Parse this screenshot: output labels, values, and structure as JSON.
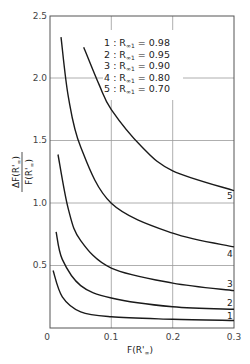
{
  "chart_data": {
    "type": "line",
    "title": "",
    "xlabel": "F(R'∞)",
    "ylabel": "ΔF(R'∞) / F(R'∞)",
    "xlim": [
      0,
      0.3
    ],
    "ylim": [
      0,
      2.5
    ],
    "xticks": [
      "0",
      "0.1",
      "0.2",
      "0.3"
    ],
    "yticks": [
      "0.5",
      "1.0",
      "1.5",
      "2.0",
      "2.5"
    ],
    "grid": true,
    "legend_position": "upper right (inside)",
    "legend": [
      {
        "id": "1",
        "label": "1 : R∞1 = 0.98"
      },
      {
        "id": "2",
        "label": "2 : R∞1 = 0.95"
      },
      {
        "id": "3",
        "label": "3 : R∞1 = 0.90"
      },
      {
        "id": "4",
        "label": "4 : R∞1 = 0.80"
      },
      {
        "id": "5",
        "label": "5 : R∞1 = 0.70"
      }
    ],
    "series": [
      {
        "name": "1",
        "R_inf1": 0.98,
        "x": [
          0.005,
          0.02,
          0.05,
          0.1,
          0.2,
          0.3
        ],
        "y": [
          0.46,
          0.25,
          0.13,
          0.09,
          0.07,
          0.06
        ]
      },
      {
        "name": "2",
        "R_inf1": 0.95,
        "x": [
          0.01,
          0.02,
          0.05,
          0.1,
          0.2,
          0.3
        ],
        "y": [
          0.77,
          0.55,
          0.34,
          0.24,
          0.17,
          0.15
        ]
      },
      {
        "name": "3",
        "R_inf1": 0.9,
        "x": [
          0.013,
          0.03,
          0.05,
          0.1,
          0.2,
          0.3
        ],
        "y": [
          1.39,
          0.95,
          0.7,
          0.48,
          0.36,
          0.3
        ]
      },
      {
        "name": "4",
        "R_inf1": 0.8,
        "x": [
          0.018,
          0.03,
          0.05,
          0.1,
          0.2,
          0.3
        ],
        "y": [
          2.33,
          1.85,
          1.45,
          1.0,
          0.76,
          0.65
        ]
      },
      {
        "name": "5",
        "R_inf1": 0.7,
        "x": [
          0.055,
          0.08,
          0.1,
          0.15,
          0.2,
          0.3
        ],
        "y": [
          2.25,
          1.95,
          1.75,
          1.45,
          1.26,
          1.1
        ]
      }
    ],
    "curve_end_labels": [
      "1",
      "2",
      "3",
      "4",
      "5"
    ]
  },
  "axes": {
    "x_tick_labels": [
      "0",
      "0.1",
      "0.2",
      "0.3"
    ],
    "y_tick_labels": [
      "0.5",
      "1.0",
      "1.5",
      "2.0",
      "2.5"
    ],
    "xlabel_main": "F(R'",
    "xlabel_sub": "∞",
    "xlabel_close": ")",
    "ylabel_num_main": "ΔF(R'",
    "ylabel_num_sub": "∞",
    "ylabel_num_close": ")",
    "ylabel_den_main": "F(R'",
    "ylabel_den_sub": "∞",
    "ylabel_den_close": ")"
  },
  "legend_rows": [
    {
      "num": "1",
      "sep": " : R",
      "sub": "∞1",
      "value": " = 0.98"
    },
    {
      "num": "2",
      "sep": " : R",
      "sub": "∞1",
      "value": " = 0.95"
    },
    {
      "num": "3",
      "sep": " : R",
      "sub": "∞1",
      "value": " = 0.90"
    },
    {
      "num": "4",
      "sep": " : R",
      "sub": "∞1",
      "value": " = 0.80"
    },
    {
      "num": "5",
      "sep": " : R",
      "sub": "∞1",
      "value": " = 0.70"
    }
  ]
}
